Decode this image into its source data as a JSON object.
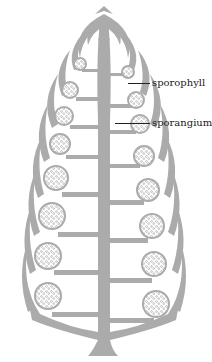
{
  "figure": {
    "fill_color": "#ababab",
    "outline_color": "#9a9a9a",
    "background": "#ffffff",
    "labels": [
      {
        "id": "sporophyll",
        "text": "sporophyll",
        "x": 152,
        "y": 77,
        "leader_from_x": 128,
        "leader_to_x": 150,
        "leader_y": 83
      },
      {
        "id": "sporangium",
        "text": "sporangium",
        "x": 152,
        "y": 117,
        "leader_from_x": 115,
        "leader_to_x": 150,
        "leader_y": 123
      }
    ],
    "left_sporangia_count": 9,
    "right_sporangia_count": 10
  }
}
